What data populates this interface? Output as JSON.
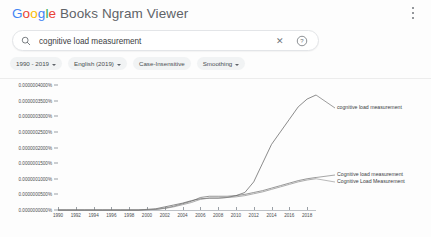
{
  "header": {
    "title": "Google Books Ngram Viewer",
    "logo_word": "Google",
    "rest_title": " Books Ngram Viewer",
    "menu_icon": "kebab-menu-icon",
    "colors": {
      "blue": "#4285f4",
      "red": "#ea4335",
      "yellow": "#fbbc05",
      "green": "#34a853",
      "grey": "#5f6368"
    }
  },
  "search": {
    "value": "cognitive load measurement",
    "placeholder": "cognitive load measurement",
    "search_icon": "search-icon",
    "clear_icon": "close-icon",
    "clear_glyph": "✕",
    "help_icon": "help-circle-icon",
    "help_glyph": "?"
  },
  "filters": [
    {
      "label": "1990 - 2019",
      "has_caret": true
    },
    {
      "label": "English (2019)",
      "has_caret": true
    },
    {
      "label": "Case-Insensitive",
      "has_caret": false
    },
    {
      "label": "Smoothing",
      "has_caret": true
    }
  ],
  "chart_data": {
    "type": "line",
    "title": "",
    "xlabel": "",
    "ylabel": "",
    "grid": false,
    "legend": "right-inline",
    "xlim": [
      1990,
      2019
    ],
    "ylim": [
      0,
      4e-07
    ],
    "ytick_labels": [
      "0.0000004000%",
      "0.0000003500%",
      "0.0000003000%",
      "0.0000002500%",
      "0.0000002000%",
      "0.0000001500%",
      "0.0000001000%",
      "0.0000000500%",
      "0.0000000000%"
    ],
    "ytick_values": [
      4e-07,
      3.5e-07,
      3e-07,
      2.5e-07,
      2e-07,
      1.5e-07,
      1e-07,
      5e-08,
      0.0
    ],
    "xtick_labels": [
      "1990",
      "1992",
      "1994",
      "1996",
      "1998",
      "2000",
      "2002",
      "2004",
      "2006",
      "2008",
      "2010",
      "2012",
      "2014",
      "2016",
      "2018"
    ],
    "x": [
      1990,
      1991,
      1992,
      1993,
      1994,
      1995,
      1996,
      1997,
      1998,
      1999,
      2000,
      2001,
      2002,
      2003,
      2004,
      2005,
      2006,
      2007,
      2008,
      2009,
      2010,
      2011,
      2012,
      2013,
      2014,
      2015,
      2016,
      2017,
      2018,
      2019
    ],
    "series": [
      {
        "name": "cognitive load measurement",
        "color": "#5a5a5a",
        "values": [
          0,
          0,
          0,
          0,
          0,
          0,
          0,
          0,
          0,
          0,
          2e-09,
          4e-09,
          1e-08,
          1.6e-08,
          2.2e-08,
          3e-08,
          3.6e-08,
          3.8e-08,
          3.8e-08,
          4e-08,
          4.6e-08,
          5.6e-08,
          9e-08,
          1.5e-07,
          2.1e-07,
          2.5e-07,
          2.9e-07,
          3.3e-07,
          3.55e-07,
          3.68e-07
        ]
      },
      {
        "name": "Cognitive load measurement",
        "color": "#6b6b6b",
        "values": [
          0,
          0,
          0,
          0,
          0,
          0,
          0,
          0,
          0,
          0,
          1e-09,
          2e-09,
          6e-09,
          1.2e-08,
          2e-08,
          2.8e-08,
          4e-08,
          4.4e-08,
          4.4e-08,
          4.4e-08,
          4.6e-08,
          5e-08,
          5.6e-08,
          6.2e-08,
          7e-08,
          7.8e-08,
          8.6e-08,
          9.4e-08,
          1e-07,
          1.04e-07
        ]
      },
      {
        "name": "Cognitive Load Measurement",
        "color": "#8a8a8a",
        "values": [
          0,
          0,
          0,
          0,
          0,
          0,
          0,
          0,
          0,
          0,
          1e-09,
          2e-09,
          5e-09,
          1e-08,
          1.7e-08,
          2.4e-08,
          3.4e-08,
          3.8e-08,
          3.8e-08,
          4e-08,
          4.2e-08,
          4.6e-08,
          5.2e-08,
          5.8e-08,
          6.6e-08,
          7.4e-08,
          8.2e-08,
          9e-08,
          9.6e-08,
          1e-07
        ]
      }
    ],
    "annotations": [
      {
        "text": "cognitive load measurement",
        "x": 337,
        "y": 104
      },
      {
        "text": "Cognitive load measurement",
        "x": 337,
        "y": 171
      },
      {
        "text": "Cognitive Load Measurement",
        "x": 337,
        "y": 178
      }
    ]
  }
}
